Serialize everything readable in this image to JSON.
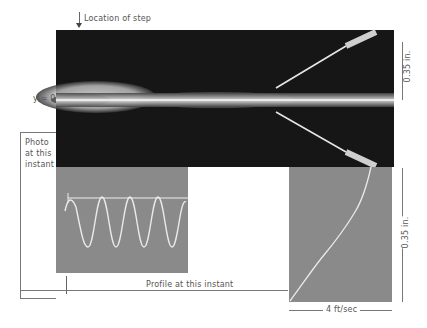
{
  "figure": {
    "top_label": "Location of step",
    "y_axis_label": "y = 0",
    "left_label_lines": [
      "Photo",
      "at this",
      "instant"
    ],
    "bottom_label": "Profile at this instant",
    "right_top_dimension": "0.35 in.",
    "right_bottom_dimension": "0.35 in.",
    "bottom_dimension": "4 ft/sec"
  },
  "panels": {
    "main_photo": "smoke-visualization-photo",
    "left_panel": "oscilloscope-trace",
    "right_panel": "velocity-profile-trace"
  }
}
